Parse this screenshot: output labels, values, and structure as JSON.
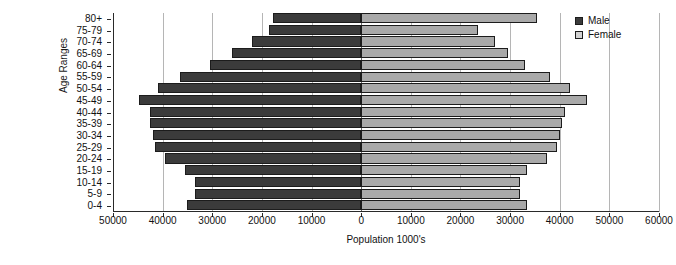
{
  "chart_data": {
    "type": "bar",
    "subtype": "population-pyramid",
    "title": "",
    "xlabel": "Population 1000's",
    "ylabel": "Age Ranges",
    "grid": true,
    "legend_position": "top-right",
    "categories": [
      "0-4",
      "5-9",
      "10-14",
      "15-19",
      "20-24",
      "25-29",
      "30-34",
      "35-39",
      "40-44",
      "45-49",
      "50-54",
      "55-59",
      "60-64",
      "65-69",
      "70-74",
      "75-79",
      "80+"
    ],
    "axis": {
      "left_max": 50000,
      "right_max": 60000,
      "left_ticks": [
        50000,
        40000,
        30000,
        20000,
        10000,
        0
      ],
      "right_ticks": [
        0,
        10000,
        20000,
        30000,
        40000,
        50000,
        60000
      ],
      "tick_labels": [
        "50000",
        "40000",
        "30000",
        "20000",
        "10000",
        "0",
        "10000",
        "20000",
        "30000",
        "40000",
        "50000",
        "60000"
      ],
      "tick_values": [
        -50000,
        -40000,
        -30000,
        -20000,
        -10000,
        0,
        10000,
        20000,
        30000,
        40000,
        50000,
        60000
      ]
    },
    "series": [
      {
        "name": "Male",
        "color": "#3b3b3b",
        "direction": "left",
        "values": [
          35000,
          33500,
          33500,
          35500,
          39500,
          41500,
          42000,
          42500,
          42500,
          44800,
          41000,
          36500,
          30500,
          26000,
          22000,
          18500,
          17700
        ]
      },
      {
        "name": "Female",
        "color": "#a9a9a9",
        "direction": "right",
        "values": [
          33500,
          32000,
          32000,
          33500,
          37500,
          39500,
          40000,
          40500,
          41000,
          45500,
          42000,
          38000,
          33000,
          29500,
          27000,
          23500,
          35500
        ]
      }
    ]
  },
  "legend": {
    "items": [
      {
        "label": "Male",
        "color": "#3b3b3b"
      },
      {
        "label": "Female",
        "color": "#d2d2d2"
      }
    ]
  }
}
